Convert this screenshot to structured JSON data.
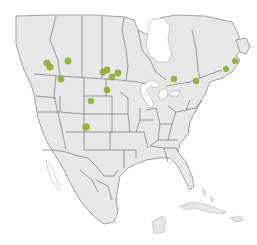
{
  "map": {
    "title": "",
    "region": "North America",
    "colors": {
      "land": "#e8e8e8",
      "border": "#555555",
      "water": "#ffffff",
      "marker": "#8fac2e"
    },
    "markers": [
      {
        "id": "m1",
        "x": 47,
        "y": 63,
        "r": 3.6
      },
      {
        "id": "m2",
        "x": 50,
        "y": 67,
        "r": 3.6
      },
      {
        "id": "m3",
        "x": 68,
        "y": 61,
        "r": 3.4
      },
      {
        "id": "m4",
        "x": 61,
        "y": 79,
        "r": 3.4
      },
      {
        "id": "m5",
        "x": 103,
        "y": 72,
        "r": 3.4
      },
      {
        "id": "m6",
        "x": 107,
        "y": 70,
        "r": 3.4
      },
      {
        "id": "m7",
        "x": 112,
        "y": 77,
        "r": 3.4
      },
      {
        "id": "m8",
        "x": 118,
        "y": 73,
        "r": 3.4
      },
      {
        "id": "m9",
        "x": 107,
        "y": 90,
        "r": 3.2
      },
      {
        "id": "m10",
        "x": 91,
        "y": 101,
        "r": 3.2
      },
      {
        "id": "m11",
        "x": 86,
        "y": 127,
        "r": 3.8
      },
      {
        "id": "m12",
        "x": 174,
        "y": 79,
        "r": 3.2
      },
      {
        "id": "m13",
        "x": 196,
        "y": 81,
        "r": 3.2
      },
      {
        "id": "m14",
        "x": 226,
        "y": 69,
        "r": 3.0
      },
      {
        "id": "m15",
        "x": 235,
        "y": 61,
        "r": 3.0
      }
    ]
  }
}
